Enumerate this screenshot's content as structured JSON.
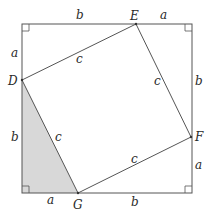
{
  "diagram": {
    "colors": {
      "line": "#555555",
      "shade": "#d8d8d8",
      "background": "#ffffff"
    },
    "points": {
      "E": "E",
      "D": "D",
      "F": "F",
      "G": "G"
    },
    "side_labels": {
      "top_b": "b",
      "top_a": "a",
      "left_a": "a",
      "left_b": "b",
      "right_b": "b",
      "right_a": "a",
      "bottom_a": "a",
      "bottom_b": "b",
      "DE_c": "c",
      "EF_c": "c",
      "FG_c": "c",
      "GD_c": "c"
    }
  }
}
